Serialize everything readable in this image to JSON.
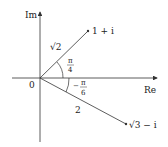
{
  "axes": {
    "imag_label": "Im",
    "real_label": "Re",
    "origin_label": "0"
  },
  "points": [
    {
      "label": "1 + i",
      "modulus_label": "√2",
      "angle_num": "π",
      "angle_den": "4",
      "angle_sign": ""
    },
    {
      "label": "√3 − i",
      "modulus_label": "2",
      "angle_num": "π",
      "angle_den": "6",
      "angle_sign": "−"
    }
  ],
  "colors": {
    "line": "#333333",
    "text": "#222222"
  }
}
